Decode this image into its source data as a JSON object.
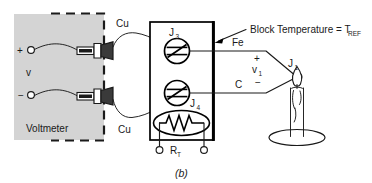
{
  "figure": {
    "caption": "(b)",
    "title_annotation": "Block Temperature = T",
    "title_annotation_sub": "REF"
  },
  "voltmeter": {
    "label": "Voltmeter",
    "meter_symbol": "v",
    "terminal_plus": "+",
    "terminal_minus": "−",
    "enclosure_note": "dashed-boundary"
  },
  "lead_wires": {
    "upper_label": "Cu",
    "lower_label": "Cu"
  },
  "isothermal_block": {
    "junction_upper": "J",
    "junction_upper_sub": "3",
    "junction_lower": "J",
    "junction_lower_sub": "4",
    "sensor_label": "R",
    "sensor_label_sub": "T"
  },
  "thermocouple": {
    "wire_positive": "Fe",
    "wire_negative": "C",
    "voltage_label": "v",
    "voltage_label_sub": "1",
    "polarity_plus": "+",
    "polarity_minus": "−",
    "measuring_junction": "J",
    "measuring_junction_sub": "1",
    "heat_source": "candle-flame"
  },
  "colors": {
    "ink": "#1a1a1a",
    "block_fill": "#ffffff",
    "voltmeter_fill": "#d4d4d4",
    "flame_fill": "#ffffff",
    "page_background": "#ffffff"
  }
}
